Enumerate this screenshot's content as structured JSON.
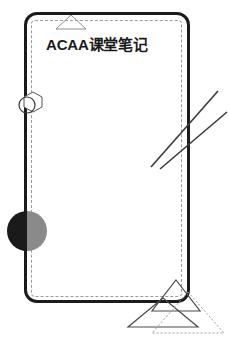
{
  "poster": {
    "title": "ACAA课堂笔记",
    "background_color": "#ffffff",
    "frame": {
      "style": "rounded-rectangle",
      "stroke_color": "#1b1b1b",
      "stroke_width": 3,
      "corner_radius": 13
    },
    "inner_frame": {
      "style": "dashed-rectangle",
      "stroke_color": "#9a9a9a",
      "stroke_width": 1
    },
    "decorations": [
      {
        "name": "top-triangle",
        "shape": "triangle-outline",
        "stroke_color": "#8f8f8f",
        "fill": "none"
      },
      {
        "name": "circle-hexagon-cluster",
        "shape": "circle-overlapping-hexagon",
        "stroke_color": "#555555",
        "fill": "none"
      },
      {
        "name": "half-tone-circle",
        "shape": "circle-split-vertically",
        "left_half_color": "#1a1a1a",
        "right_half_color": "#8a8a8a"
      },
      {
        "name": "parallel-diagonal-lines",
        "shape": "two-parallel-lines",
        "stroke_color": "#3a3a3a",
        "count": 2
      },
      {
        "name": "bottom-triangle-pair",
        "shape": "two-overlapping-triangles",
        "solid_stroke_color": "#4a4a4a",
        "dotted_stroke_color": "#9a9a9a"
      }
    ]
  }
}
